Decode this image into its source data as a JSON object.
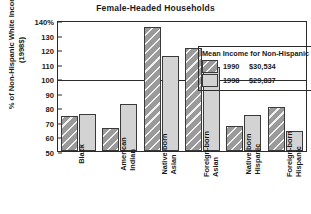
{
  "chart_data": {
    "type": "bar",
    "title": "Female-Headed  Households",
    "xlabel": "",
    "ylabel": "% of Non-Hispanic White Income (1998$)",
    "ylim": [
      50,
      140
    ],
    "ytick_values": [
      140,
      130,
      120,
      110,
      100,
      90,
      80,
      70,
      60,
      50
    ],
    "ytick_labels": [
      "140%",
      "130",
      "120",
      "110",
      "100",
      "90",
      "80",
      "70",
      "60",
      "50"
    ],
    "grid": false,
    "reference_line": 100,
    "legend_position": "inside-top-right",
    "categories": [
      "Black",
      "American Indian",
      "Native-born Asian",
      "Foreign-born Asian",
      "Native-born Hispanic",
      "Foreign-born Hispanic"
    ],
    "series": [
      {
        "name": "1990",
        "color": "#9a9a9a",
        "values": [
          74,
          66,
          135,
          121,
          67,
          80
        ]
      },
      {
        "name": "1998",
        "color": "#d3d3d3",
        "values": [
          75.5,
          82,
          115,
          108,
          75,
          64
        ]
      }
    ]
  },
  "legend": {
    "title": "Mean Income for Non-Hispanic Whites",
    "entries": [
      {
        "year": "1990",
        "value": "$30,534",
        "swatch": "hatched-dark-gray-swatch"
      },
      {
        "year": "1998",
        "value": "$29,837",
        "swatch": "light-gray-swatch"
      }
    ]
  }
}
